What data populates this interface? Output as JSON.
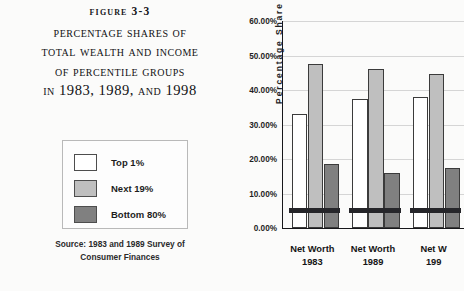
{
  "figure": {
    "number": "Figure 3-3",
    "title_lines": [
      "Percentage shares of",
      "Total Wealth and Income",
      "of Percentile Groups",
      "in 1983, 1989, and 1998"
    ],
    "source_line_1": "Source: 1983 and 1989 Survey of",
    "source_line_2": "Consumer Finances"
  },
  "legend": {
    "items": [
      {
        "label": "Top 1%",
        "color": "#ffffff"
      },
      {
        "label": "Next 19%",
        "color": "#bfbfbf"
      },
      {
        "label": "Bottom 80%",
        "color": "#808080"
      }
    ]
  },
  "chart_data": {
    "type": "bar",
    "title": "Percentage shares of Total Wealth and Income of Percentile Groups in 1983, 1989, and 1998",
    "xlabel": "",
    "ylabel": "Percentage Share",
    "ylim": [
      0,
      60
    ],
    "ytick_values": [
      0,
      10,
      20,
      30,
      40,
      50,
      60
    ],
    "ytick_labels": [
      "0.00%",
      "10.00%",
      "20.00%",
      "30.00%",
      "40.00%",
      "50.00%",
      "60.00%"
    ],
    "grid": true,
    "legend_position": "outside-left",
    "categories": [
      "Net Worth 1983",
      "Net Worth 1989",
      "Net Worth 1998"
    ],
    "category_lines": [
      [
        "Net Worth",
        "1983"
      ],
      [
        "Net Worth",
        "1989"
      ],
      [
        "Net W",
        "199"
      ]
    ],
    "series": [
      {
        "name": "Top 1%",
        "color": "#ffffff",
        "values": [
          33.0,
          37.5,
          38.0
        ]
      },
      {
        "name": "Next 19%",
        "color": "#bfbfbf",
        "values": [
          47.5,
          46.0,
          44.5
        ]
      },
      {
        "name": "Bottom 80%",
        "color": "#808080",
        "values": [
          18.5,
          16.0,
          17.5
        ]
      }
    ],
    "note": "Third category is clipped at the right edge of the screenshot."
  }
}
